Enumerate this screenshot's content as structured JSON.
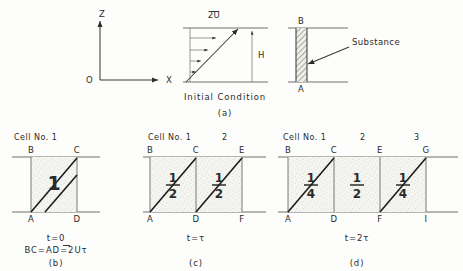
{
  "figure": {
    "panels": [
      "(a)",
      "(b)",
      "(c)",
      "(d)"
    ]
  },
  "panel_a": {
    "axes": {
      "origin": "O",
      "x_label": "X",
      "z_label": "Z"
    },
    "velocity_profile": {
      "top_label": "2U",
      "overbar": true,
      "height_label": "H",
      "arrow_count": 4,
      "caption": "Initial Condition"
    },
    "substance_panel": {
      "top_label": "B",
      "bottom_label": "A",
      "annotation": "Substance"
    },
    "panel_label": "(a)"
  },
  "panel_b": {
    "header": "Cell No. 1",
    "cells": [
      {
        "index": "1",
        "value": "1",
        "display": "integer",
        "top_left": "B",
        "top_right": "C",
        "bottom_left": "A",
        "bottom_right": "D",
        "diagonals": 2
      }
    ],
    "time_label": "t=0",
    "relation": "BC=AD=2Uτ",
    "relation_overbar_char": "U",
    "panel_label": "(b)"
  },
  "panel_c": {
    "header": "Cell No. 1",
    "header_numbers": [
      "2"
    ],
    "cells": [
      {
        "index": "1",
        "numerator": "1",
        "denominator": "2",
        "top_left": "B",
        "top_right": "C",
        "bottom_left": "A",
        "bottom_right": "D",
        "diagonals": 1
      },
      {
        "index": "2",
        "numerator": "1",
        "denominator": "2",
        "top_left": "C",
        "top_right": "E",
        "bottom_left": "D",
        "bottom_right": "F",
        "diagonals": 1
      }
    ],
    "time_label": "t=τ",
    "panel_label": "(c)"
  },
  "panel_d": {
    "header": "Cell No. 1",
    "header_numbers": [
      "2",
      "3"
    ],
    "cells": [
      {
        "index": "1",
        "numerator": "1",
        "denominator": "4",
        "top_left": "B",
        "top_right": "C",
        "bottom_left": "A",
        "bottom_right": "D",
        "diagonals": 1
      },
      {
        "index": "2",
        "numerator": "1",
        "denominator": "2",
        "top_left": "C",
        "top_right": "E",
        "bottom_left": "D",
        "bottom_right": "F",
        "diagonals": 0
      },
      {
        "index": "3",
        "numerator": "1",
        "denominator": "4",
        "top_left": "E",
        "top_right": "G",
        "bottom_left": "F",
        "bottom_right": "I",
        "diagonals": 1
      }
    ],
    "time_label": "t=2τ",
    "panel_label": "(d)"
  },
  "colors": {
    "background": "#fdfdfb",
    "ink": "#2b2b2b",
    "line": "#555555",
    "shade": "#f1f1ec"
  }
}
